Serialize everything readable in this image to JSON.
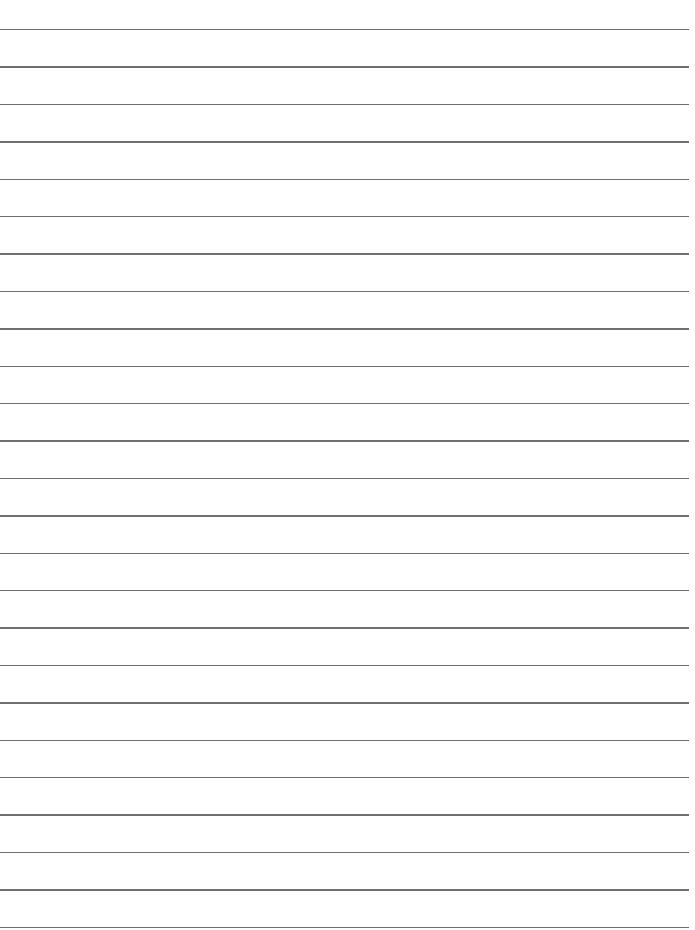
{
  "page": {
    "type": "lined-paper",
    "background_color": "#ffffff",
    "rule_color": "#6e6e6e",
    "rule_count": 25,
    "first_rule_y": 29,
    "rule_spacing": 37.4,
    "rule_left": 0,
    "rule_width": 689,
    "text_lines": []
  }
}
